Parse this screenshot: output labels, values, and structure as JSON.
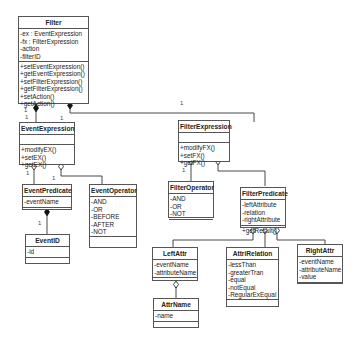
{
  "diagram": {
    "type": "UML class diagram",
    "classes": {
      "filter": {
        "name": "Filter",
        "attributes": [
          "-ex : EventExpression",
          "-fx : FilterExpression",
          "-action",
          "-filterID"
        ],
        "methods": [
          "+setEventExpression()",
          "+getEventExpression()",
          "+setFilterExpression()",
          "+getFilterExpression()",
          "+setAction()",
          "+getAction()"
        ]
      },
      "event_expression": {
        "name": "EventExpression",
        "attributes": [],
        "methods": [
          "+modifyEX()",
          "+setEX()",
          "+getEX()"
        ]
      },
      "filter_expression": {
        "name": "FilterExpression",
        "attributes": [],
        "methods": [
          "+modifyFX()",
          "+setFX()",
          "+getFX()"
        ]
      },
      "event_predicate": {
        "name": "EventPredicate",
        "attributes": [
          "-eventName"
        ],
        "methods": []
      },
      "event_operator": {
        "name": "EventOperator",
        "attributes": [
          "-AND",
          "-OR",
          "-BEFORE",
          "-AFTER",
          "-NOT"
        ],
        "methods": []
      },
      "event_id": {
        "name": "EventID",
        "attributes": [
          "-id"
        ],
        "methods": []
      },
      "filter_operator": {
        "name": "FilterOperator",
        "attributes": [
          "-AND",
          "-OR",
          "-NOT"
        ],
        "methods": []
      },
      "filter_predicate": {
        "name": "FilterPredicate",
        "attributes": [
          "-leftAttribute",
          "-relation",
          "-rightAttribute"
        ],
        "methods": [
          "+getResult()"
        ]
      },
      "left_attr": {
        "name": "LeftAttr",
        "attributes": [
          "-eventName",
          "-attributeName"
        ],
        "methods": []
      },
      "attri_relation": {
        "name": "AttriRelation",
        "attributes": [
          "-lessThan",
          "-greaterTran",
          "-equal",
          "-notEqual",
          "-RegularExEqual"
        ],
        "methods": []
      },
      "right_attr": {
        "name": "RightAttr",
        "attributes": [
          "-eventName",
          "-attributeName",
          "-value"
        ],
        "methods": []
      },
      "attr_name": {
        "name": "AttrName",
        "attributes": [
          "-name"
        ],
        "methods": []
      }
    },
    "multiplicities": [
      "1",
      "1",
      "1",
      "1",
      "1",
      "1",
      "1",
      "1"
    ],
    "colors": {
      "line": "#333333",
      "border": "#555555"
    }
  }
}
